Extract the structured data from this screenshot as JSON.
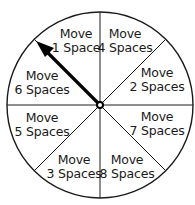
{
  "diagram": {
    "type": "spinner",
    "center": [
      100,
      105
    ],
    "radius": 93,
    "sections": 8,
    "pointer": {
      "points_to": "Move 1 Space"
    },
    "sections_list": [
      {
        "line1": "Move",
        "line2": "1 Space",
        "x": 76,
        "y": 27
      },
      {
        "line1": "Move",
        "line2": "4 Spaces",
        "x": 125,
        "y": 27
      },
      {
        "line1": "Move",
        "line2": "2 Spaces",
        "x": 157,
        "y": 66
      },
      {
        "line1": "Move",
        "line2": "7 Spaces",
        "x": 157,
        "y": 110
      },
      {
        "line1": "Move",
        "line2": "8 Spaces",
        "x": 127,
        "y": 153
      },
      {
        "line1": "Move",
        "line2": "3 Spaces",
        "x": 74,
        "y": 153
      },
      {
        "line1": "Move",
        "line2": "5 Spaces",
        "x": 42,
        "y": 111
      },
      {
        "line1": "Move",
        "line2": "6 Spaces",
        "x": 42,
        "y": 69
      }
    ]
  },
  "colors": {
    "stroke": "#1a1a1a",
    "fill": "#ffffff"
  }
}
